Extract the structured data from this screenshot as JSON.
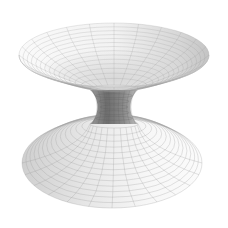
{
  "figure": {
    "title": "",
    "background": "#ffffff",
    "colors": {
      "grid_line": "#9a9a9a",
      "surface_light": "#f6f6f6",
      "surface_mid": "#d9d9d9",
      "surface_dark": "#7a7a7a",
      "throat_dark": "#6e6e6e"
    },
    "geometry": {
      "top_rim": {
        "cx": 114,
        "cy": 55,
        "rx": 95,
        "ry": 32
      },
      "throat": {
        "cx": 114,
        "y_top": 90,
        "y_min": 105,
        "y_bottom": 124,
        "half_width_min": 14,
        "half_width_top": 24,
        "half_width_bottom": 24
      },
      "bottom_rim": {
        "cx": 112,
        "cy": 163,
        "rx": 90,
        "ry": 45
      },
      "rings_top": 14,
      "rings_bottom": 14,
      "meridians": 24
    }
  }
}
